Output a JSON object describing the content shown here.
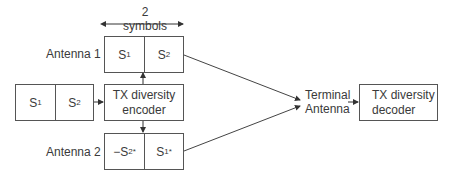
{
  "diagram": {
    "span_label": "2 symbols",
    "input_block": {
      "cells": [
        {
          "base": "S",
          "sub": "1",
          "sup": ""
        },
        {
          "base": "S",
          "sub": "2",
          "sup": ""
        }
      ]
    },
    "encoder": {
      "line1": "TX diversity",
      "line2": "encoder"
    },
    "antenna1": {
      "label": "Antenna 1",
      "cells": [
        {
          "base": "S",
          "sub": "1",
          "sup": ""
        },
        {
          "base": "S",
          "sub": "2",
          "sup": ""
        }
      ]
    },
    "antenna2": {
      "label": "Antenna 2",
      "cells": [
        {
          "base": "−S",
          "sub": "2",
          "sup": "*"
        },
        {
          "base": "S",
          "sub": "1",
          "sup": "*"
        }
      ]
    },
    "terminal": {
      "line1": "Terminal",
      "line2": "Antenna"
    },
    "decoder": {
      "line1": "TX diversity",
      "line2": "decoder"
    },
    "colors": {
      "stroke": "#555555",
      "text": "#3a3a3a",
      "background": "#ffffff"
    }
  }
}
